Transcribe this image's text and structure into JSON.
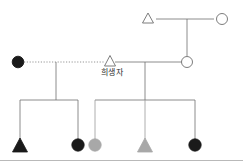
{
  "figure": {
    "type": "pedigree-chart",
    "title": "",
    "background_color": "#ffffff",
    "line_color": "#6e6e6e",
    "baseline_color": "#b9b9b9",
    "labels": {
      "proband": "희생자"
    }
  },
  "legend_colors": {
    "affected_black": "#1a1a1a",
    "carrier_gray": "#a8a8a8",
    "unaffected_white": "#ffffff",
    "outline": "#6e6e6e"
  },
  "generations": [
    {
      "id": "I",
      "members": [
        {
          "id": "I-1",
          "shape": "triangle",
          "fill": "unaffected_white",
          "x": 148,
          "y": 19,
          "label": ""
        },
        {
          "id": "I-2",
          "shape": "circle",
          "fill": "unaffected_white",
          "x": 222,
          "y": 19,
          "label": ""
        }
      ],
      "matings": [
        {
          "between": [
            "I-1",
            "I-2"
          ],
          "line_style": "solid",
          "y": 19,
          "descent_x": 187,
          "descent_to_y": 62
        }
      ]
    },
    {
      "id": "II",
      "members": [
        {
          "id": "II-1",
          "shape": "circle",
          "fill": "affected_black",
          "x": 18,
          "y": 62,
          "label": ""
        },
        {
          "id": "II-2",
          "shape": "triangle",
          "fill": "unaffected_white",
          "x": 110,
          "y": 62,
          "label": "희생자"
        },
        {
          "id": "II-3",
          "shape": "circle",
          "fill": "unaffected_white",
          "x": 187,
          "y": 62,
          "label": ""
        }
      ],
      "matings": [
        {
          "between": [
            "II-1",
            "II-2"
          ],
          "line_style": "dotted",
          "y": 62,
          "descent_x": 56,
          "descent_to_y": 100
        },
        {
          "between": [
            "II-2",
            "II-3"
          ],
          "line_style": "solid",
          "y": 62,
          "descent_x": 145,
          "descent_to_y": 100
        }
      ]
    },
    {
      "id": "III",
      "sibships": [
        {
          "parents": [
            "II-1",
            "II-2"
          ],
          "bar_y": 100,
          "bar_x_start": 20,
          "bar_x_end": 78,
          "children": [
            "III-1",
            "III-2"
          ]
        },
        {
          "parents": [
            "II-2",
            "II-3"
          ],
          "bar_y": 100,
          "bar_x_start": 95,
          "bar_x_end": 195,
          "children": [
            "III-3",
            "III-4",
            "III-5"
          ]
        }
      ],
      "members": [
        {
          "id": "III-1",
          "shape": "triangle",
          "fill": "affected_black",
          "x": 20,
          "y": 145,
          "label": ""
        },
        {
          "id": "III-2",
          "shape": "circle",
          "fill": "affected_black",
          "x": 78,
          "y": 145,
          "label": ""
        },
        {
          "id": "III-3",
          "shape": "circle",
          "fill": "carrier_gray",
          "x": 95,
          "y": 145,
          "label": ""
        },
        {
          "id": "III-4",
          "shape": "triangle",
          "fill": "carrier_gray",
          "x": 145,
          "y": 145,
          "label": ""
        },
        {
          "id": "III-5",
          "shape": "circle",
          "fill": "affected_black",
          "x": 195,
          "y": 145,
          "label": ""
        }
      ]
    }
  ],
  "baseline": {
    "y": 160,
    "x_start": 0,
    "x_end": 243
  }
}
